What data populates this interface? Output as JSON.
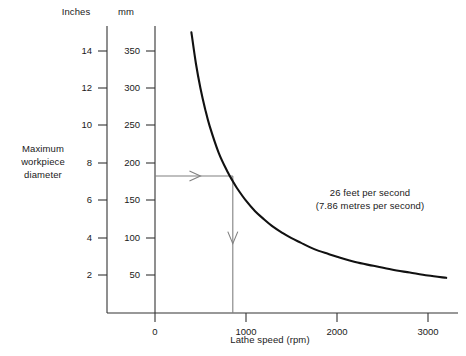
{
  "axes": {
    "left_header": "Inches",
    "right_header": "mm",
    "y_label_lines": [
      "Maximum",
      "workpiece",
      "diameter"
    ],
    "x_label": "Lathe speed (rpm)",
    "inches_ticks": [
      2,
      4,
      6,
      8,
      10,
      12,
      14
    ],
    "mm_ticks": [
      50,
      100,
      150,
      200,
      250,
      300,
      350
    ],
    "x_ticks": [
      0,
      1000,
      2000,
      3000
    ]
  },
  "annotation": {
    "line1": "26 feet per second",
    "line2": "(7.86 metres per second)"
  },
  "colors": {
    "curve": "#111111",
    "axis": "#333333",
    "guide": "#808080",
    "text": "#1a1a1a",
    "background": "#ffffff"
  },
  "chart_data": {
    "type": "line",
    "title": "",
    "subtitle": "",
    "xlabel": "Lathe speed (rpm)",
    "ylabel": "Maximum workpiece diameter",
    "ylabel_primary_units": "Inches",
    "ylabel_secondary_units": "mm",
    "xlim": [
      0,
      3200
    ],
    "ylim_mm": [
      0,
      375
    ],
    "ylim_inches": [
      0,
      14.8
    ],
    "grid": false,
    "legend": null,
    "annotations": [
      {
        "text": "26 feet per second (7.86 metres per second)",
        "x": 1850,
        "y_mm": 130
      }
    ],
    "guides": [
      {
        "type": "horizontal-arrow",
        "from_x": 0,
        "to_x": 855,
        "y_mm": 183,
        "y_inches": 7.2
      },
      {
        "type": "vertical-arrow",
        "x": 855,
        "from_y_mm": 183,
        "to_y_mm": 0
      }
    ],
    "series": [
      {
        "name": "Max workpiece diameter at 7.86 m/s surface speed",
        "x": [
          400,
          450,
          500,
          550,
          600,
          700,
          800,
          855,
          900,
          1000,
          1100,
          1200,
          1300,
          1400,
          1500,
          1600,
          1700,
          1800,
          1900,
          2000,
          2200,
          2400,
          2600,
          2800,
          3000,
          3200
        ],
        "values_mm": [
          375,
          333,
          300,
          273,
          250,
          214,
          188,
          176,
          167,
          150,
          136,
          125,
          115,
          107,
          100,
          94,
          88,
          83,
          79,
          75,
          68,
          63,
          58,
          54,
          50,
          47
        ],
        "values_inches": [
          14.8,
          13.1,
          11.8,
          10.7,
          9.8,
          8.4,
          7.4,
          6.9,
          6.6,
          5.9,
          5.4,
          4.9,
          4.5,
          4.2,
          3.9,
          3.7,
          3.5,
          3.3,
          3.1,
          3.0,
          2.7,
          2.5,
          2.3,
          2.1,
          2.0,
          1.8
        ]
      }
    ]
  }
}
